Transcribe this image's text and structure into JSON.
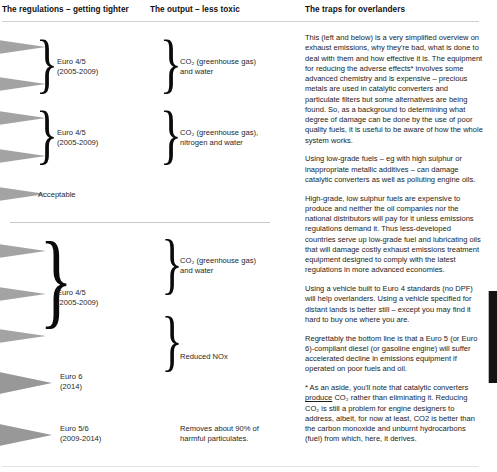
{
  "headers": {
    "col1": "The regulations – getting tighter",
    "col2": "The output – less toxic",
    "col3": "The traps for overlanders"
  },
  "diagram": {
    "top_section": {
      "rows": [
        {
          "id": "row-euro45-a",
          "regulation": "Euro 4/5\n(2005-2009)",
          "output": "CO₂ (greenhouse gas)\nand water",
          "arrow_count": 2,
          "arrow_size": "small"
        },
        {
          "id": "row-euro45-b",
          "regulation": "Euro 4/5\n(2005-2009)",
          "output": "CO₂ (greenhouse gas),\nnitrogen and water",
          "arrow_count": 2,
          "arrow_size": "small"
        },
        {
          "id": "row-acceptable",
          "regulation": "Acceptable",
          "output": "",
          "arrow_count": 1,
          "arrow_size": "small"
        }
      ]
    },
    "bottom_section": {
      "rows": [
        {
          "id": "row-euro45-c",
          "regulation": "Euro 4/5\n(2005-2009)",
          "output": "CO₂ (greenhouse gas)\nand water",
          "arrow_count": 3,
          "arrow_size": "small"
        },
        {
          "id": "row-nox",
          "regulation": "",
          "output": "Reduced NOx",
          "arrow_count": 0,
          "arrow_size": "small"
        },
        {
          "id": "row-euro6",
          "regulation": "Euro 6\n(2014)",
          "output": "",
          "arrow_count": 1,
          "arrow_size": "large"
        },
        {
          "id": "row-euro56",
          "regulation": "Euro 5/6\n(2009-2014)",
          "output": "Removes about 90% of\nharmful particulates.",
          "arrow_count": 1,
          "arrow_size": "large"
        }
      ]
    },
    "labels": {
      "euro45_a": "Euro 4/5\n(2005-2009)",
      "euro45_b": "Euro 4/5\n(2005-2009)",
      "acceptable": "Acceptable",
      "euro45_c": "Euro 4/5\n(2005-2009)",
      "euro6": "Euro 6\n(2014)",
      "euro56": "Euro 5/6\n(2009-2014)",
      "out_a": "CO₂ (greenhouse gas)\nand water",
      "out_b": "CO₂ (greenhouse gas),\nnitrogen and water",
      "out_c": "CO₂ (greenhouse gas)\nand water",
      "out_nox": "Reduced NOx",
      "out_particulates": "Removes about 90% of\nharmful particulates."
    }
  },
  "body": {
    "paragraphs": [
      "This (left and below) is a very simplified overview on exhaust emissions, why they're bad, what is done to deal with them and how effective it is. The equipment for reducing the adverse effects* involves some advanced chemistry and is expensive – precious metals are used in catalytic converters and particulate filters but some alternatives are being found. So, as a background to determining what degree of damage can be done by the use of poor quality fuels, it is useful to be aware of how the whole system works.",
      "Using low-grade fuels – eg with high sulphur or inappropriate metallic additives – can damage catalytic converters as well as polluting engine oils.",
      "High-grade, low sulphur fuels are expensive to produce and neither the oil companies nor the national distributors will pay for it unless emissions regulations demand it. Thus less-developed countries serve up low-grade fuel and lubricating oils that will damage costly exhaust emissions treatment equipment designed to comply with the latest regulations in more advanced economies.",
      "Using a vehicle built to Euro 4 standards (no DPF) will help overlanders. Using a vehicle specified for distant lands is better still – except you may find it hard to buy one where you are.",
      "Regrettably the bottom line is that a Euro 5 (or Euro 6)-compliant diesel (or gasoline engine) will suffer accelerated decline in emissions equipment if operated on poor fuels and oil."
    ],
    "footnote_pre": "* As an aside, you'll note that catalytic converters ",
    "footnote_underlined": "produce",
    "footnote_post": " CO₂ rather than eliminating it. Reducing CO₂ is still a problem for engine designers to address, albeit, for now at least, CO2 is better than the carbon monoxide and unburnt hydrocarbons (fuel) from which, here, it derives."
  },
  "colors": {
    "arrow_gray": "#9a9a9a",
    "rule_gray": "#cfcfcf",
    "edge_bar": "#141414",
    "text": "#1d1d1d"
  },
  "glyphs": {
    "brace": "}"
  }
}
